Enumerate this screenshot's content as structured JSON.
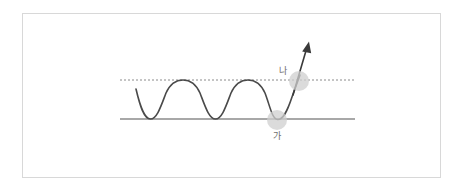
{
  "figure": {
    "title": "",
    "background_color": "#ffffff",
    "frame": {
      "border_color": "#d8d8d8",
      "x": 22,
      "y": 13,
      "width": 419,
      "height": 165
    }
  },
  "diagram": {
    "type": "physics-wave-schematic",
    "baseline": {
      "style": "solid",
      "color": "#a8a8a8",
      "x_start": 120,
      "x_end": 355,
      "y": 119,
      "thickness": 2
    },
    "upper_level": {
      "style": "dotted",
      "color": "#8a8a8a",
      "x_start": 120,
      "x_end": 355,
      "y": 80,
      "thickness": 1
    },
    "wave": {
      "color": "#4a4a4a",
      "thickness": 1.6,
      "x_start": 136,
      "x_end": 300,
      "crest_y": 80,
      "trough_y": 119,
      "period_px": 65,
      "troughs_x": [
        150,
        215,
        277
      ],
      "crests_x": [
        183,
        248
      ]
    },
    "arrow": {
      "color": "#3a3a3a",
      "tail_x": 285,
      "tail_y": 105,
      "tip_x": 309,
      "tip_y": 42,
      "thickness": 1.6,
      "head": "solid-triangle"
    },
    "balls": [
      {
        "id": "ball-ga",
        "label": "가",
        "fill": "#cfcfcf",
        "opacity": 0.75,
        "center_x": 277,
        "center_y": 120,
        "radius": 10,
        "label_x": 277,
        "label_y": 136,
        "label_position": "below"
      },
      {
        "id": "ball-na",
        "label": "나",
        "fill": "#cfcfcf",
        "opacity": 0.75,
        "center_x": 299,
        "center_y": 81,
        "radius": 10,
        "label_x": 283,
        "label_y": 73,
        "label_position": "upper-left"
      }
    ],
    "colors": {
      "curve": "#4a4a4a",
      "baseline": "#a8a8a8",
      "dotted_line": "#8a8a8a",
      "ball": "#cfcfcf",
      "label": "#6e6e6e",
      "frame": "#d8d8d8"
    }
  }
}
